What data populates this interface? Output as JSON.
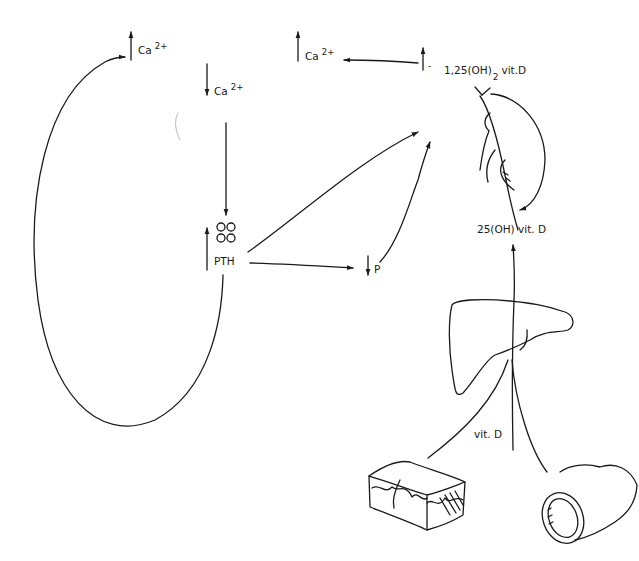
{
  "diagram": {
    "type": "calcium-regulation-feedback",
    "colors": {
      "ink": "#1a1a1a",
      "background": "#ffffff"
    },
    "labels": {
      "ca_up_left": {
        "arrow": "up",
        "base": "Ca",
        "sup": "2+"
      },
      "ca_down": {
        "arrow": "down",
        "base": "Ca",
        "sup": "2+"
      },
      "ca_up_right": {
        "arrow": "up",
        "base": "Ca",
        "sup": "2+"
      },
      "pth": {
        "arrow": "up",
        "text": "PTH"
      },
      "phosphate": {
        "arrow": "down",
        "text": "P"
      },
      "calcitriol": {
        "prefix": "1,25(OH)",
        "sub": "2",
        "suffix": "vit.D",
        "arrow": "up",
        "sign": "-"
      },
      "calcidiol": {
        "text": "25(OH) vit. D"
      },
      "vitd": {
        "text": "vit. D"
      }
    },
    "nodes": [
      {
        "id": "parathyroid",
        "icon": "four-circles-icon"
      },
      {
        "id": "kidney",
        "icon": "kidney-icon"
      },
      {
        "id": "liver",
        "icon": "liver-icon"
      },
      {
        "id": "skin",
        "icon": "skin-icon"
      },
      {
        "id": "intestine",
        "icon": "intestine-icon"
      }
    ],
    "edges": [
      {
        "from": "ca_down",
        "to": "parathyroid"
      },
      {
        "from": "pth",
        "to": "kidney"
      },
      {
        "from": "pth",
        "to": "phosphate"
      },
      {
        "from": "phosphate",
        "to": "kidney"
      },
      {
        "from": "pth",
        "to": "ca_up_left",
        "note": "feedback loop"
      },
      {
        "from": "calcitriol",
        "to": "ca_up_right"
      },
      {
        "from": "calcidiol",
        "to": "kidney"
      },
      {
        "from": "skin",
        "to": "liver",
        "label": "vit. D"
      },
      {
        "from": "intestine",
        "to": "liver"
      },
      {
        "from": "liver",
        "to": "calcidiol"
      }
    ]
  }
}
